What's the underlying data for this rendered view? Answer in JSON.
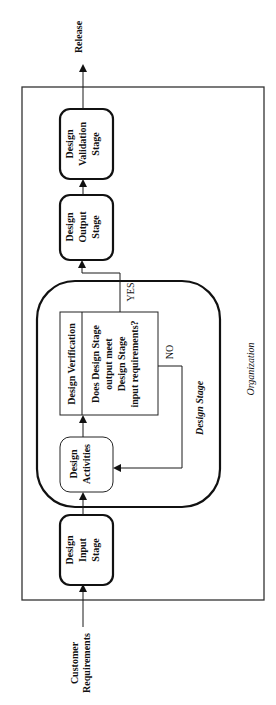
{
  "diagram": {
    "orientation": "rotated-90-ccw",
    "frame_label": "Organization",
    "design_stage_label": "Design Stage",
    "inputs": {
      "customer_requirements": [
        "Customer",
        "Requirements"
      ]
    },
    "outputs": {
      "release": "Release"
    },
    "nodes": {
      "input_stage": [
        "Design",
        "Input",
        "Stage"
      ],
      "activities": [
        "Design",
        "Activities"
      ],
      "verification_title": "Design Verification",
      "verification_question": [
        "Does Design Stage",
        "output meet",
        "Design Stage",
        "input requirements?"
      ],
      "output_stage": [
        "Design",
        "Output",
        "Stage"
      ],
      "validation_stage": [
        "Design",
        "Validation",
        "Stage"
      ]
    },
    "edges": {
      "yes_label": "YES",
      "no_label": "NO"
    },
    "colors": {
      "ink": "#111111",
      "background": "#ffffff"
    }
  }
}
